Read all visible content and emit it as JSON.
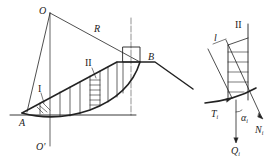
{
  "figure": {
    "left_diagram": {
      "labels": {
        "center": "O",
        "center_below": "O'",
        "radius": "R",
        "toe": "A",
        "crest": "B",
        "slice_1": "I",
        "slice_2": "II"
      }
    },
    "right_diagram": {
      "labels": {
        "slice": "II",
        "width": "l",
        "shear_force": "T",
        "shear_sub": "i",
        "normal_force": "N",
        "normal_sub": "i",
        "weight": "Q",
        "weight_sub": "i",
        "angle": "α",
        "angle_sub": "i"
      }
    },
    "colors": {
      "line": "#222222",
      "background": "#ffffff"
    }
  }
}
